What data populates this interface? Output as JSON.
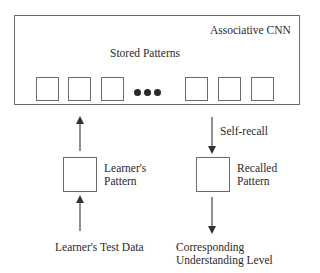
{
  "diagram": {
    "title": "Associative CNN",
    "stored_patterns_label": "Stored Patterns",
    "stored_pattern_cells": 6,
    "ellipsis": "•••",
    "learner_pattern_label_line1": "Learner's",
    "learner_pattern_label_line2": "Pattern",
    "recalled_pattern_label_line1": "Recalled",
    "recalled_pattern_label_line2": "Pattern",
    "self_recall_label": "Self-recall",
    "input_label": "Learner's Test Data",
    "output_label_line1": "Corresponding",
    "output_label_line2": "Understanding Level",
    "colors": {
      "stroke": "#6a6a6a",
      "text": "#2a2a2a",
      "arrow": "#333333"
    }
  }
}
